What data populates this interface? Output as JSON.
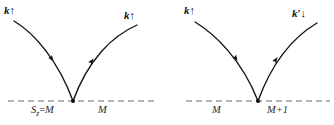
{
  "figure": {
    "colors": {
      "curve": "#101010",
      "dashed_line": "#9a9a9a",
      "vertex_dot": "#101010",
      "label_text": "#101010",
      "state_text": "#2b2b2b",
      "background": "#ffffff"
    }
  },
  "panels": [
    {
      "id": "left",
      "name": "spin-conserving-vertex",
      "incoming": {
        "symbol": "k",
        "prime": "",
        "spin_arrow": "↑",
        "label": "k↑"
      },
      "outgoing": {
        "symbol": "k",
        "prime": "",
        "spin_arrow": "↑",
        "label": "k↑"
      },
      "state_left": {
        "symbol": "S",
        "subscript": "z",
        "operator": "=",
        "value": "M",
        "label": "S_z = M"
      },
      "state_right": {
        "symbol": "",
        "subscript": "",
        "operator": "",
        "value": "M",
        "label": "M"
      }
    },
    {
      "id": "right",
      "name": "spin-flip-vertex",
      "incoming": {
        "symbol": "k",
        "prime": "",
        "spin_arrow": "↑",
        "label": "k↑"
      },
      "outgoing": {
        "symbol": "k",
        "prime": "′",
        "spin_arrow": "↓",
        "label": "k′↓"
      },
      "state_left": {
        "symbol": "",
        "subscript": "",
        "operator": "",
        "value": "M",
        "label": "M"
      },
      "state_right": {
        "symbol": "",
        "subscript": "",
        "operator": "",
        "value": "M+1",
        "label": "M+1"
      }
    }
  ]
}
